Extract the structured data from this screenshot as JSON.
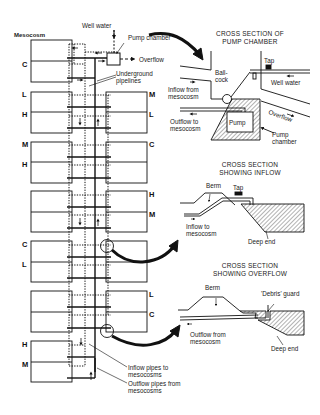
{
  "left_panel": {
    "heading": "Mesocosm",
    "top_labels": {
      "well_water": "Well water",
      "pump_chamber": "Pump chamber",
      "overflow": "Overflow",
      "underground_pipelines": [
        "Underground",
        "pipelines"
      ]
    },
    "bottom_labels": {
      "inflow_pipes": [
        "Inflow pipes to",
        "mesocosms"
      ],
      "outflow_pipes": [
        "Outflow pipes from",
        "mesocosms"
      ]
    },
    "treatment_codes": {
      "row1_left": "C",
      "row2_left_top": "L",
      "row2_left_bottom": "H",
      "row2_right_top": "M",
      "row2_right_bottom": "L",
      "row3_left_top": "M",
      "row3_left_bottom": "H",
      "row3_right_top": "C",
      "row4_right_top": "H",
      "row4_right_bottom": "M",
      "row5_left_top": "C",
      "row5_left_bottom": "L",
      "row6_right_top": "L",
      "row6_right_bottom": "C",
      "row7_left_top": "H",
      "row7_left_bottom": "M"
    }
  },
  "pump_section": {
    "title": [
      "CROSS SECTION OF",
      "PUMP CHAMBER"
    ],
    "labels": {
      "tap": "Tap",
      "ball_cock": [
        "Ball-",
        "cock"
      ],
      "well_water": "Well water",
      "inflow_from": [
        "Inflow from",
        "mesocosm"
      ],
      "outflow_to": [
        "Outflow to",
        "mesocosm"
      ],
      "pump": "Pump",
      "overflow": "Overflow",
      "pump_chamber": [
        "Pump",
        "chamber"
      ]
    }
  },
  "inflow_section": {
    "title": [
      "CROSS SECTION",
      "SHOWING INFLOW"
    ],
    "labels": {
      "berm": "Berm",
      "tap": "Tap",
      "inflow_to": [
        "Inflow to",
        "mesocosm"
      ],
      "deep_end": "Deep end"
    }
  },
  "overflow_section": {
    "title": [
      "CROSS SECTION",
      "SHOWING OVERFLOW"
    ],
    "labels": {
      "berm": "Berm",
      "debris_guard": "'Debris' guard",
      "outflow_from": [
        "Outflow from",
        "mesocosm"
      ],
      "deep_end": "Deep end"
    }
  }
}
